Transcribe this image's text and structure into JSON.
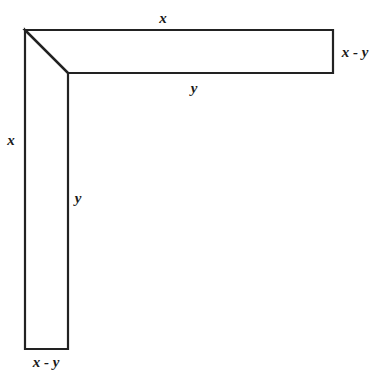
{
  "diagram": {
    "stroke_color": "#222222",
    "labels": {
      "top_edge": "x",
      "right_edge": "x - y",
      "inner_horizontal_edge": "y",
      "left_edge": "x",
      "inner_vertical_edge": "y",
      "bottom_edge": "x - y"
    },
    "geometry": {
      "outer_corner": [
        25,
        30
      ],
      "inner_corner": [
        68,
        73
      ],
      "top_right": [
        333,
        30
      ],
      "right_bottom": [
        333,
        73
      ],
      "bottom_left": [
        25,
        349
      ],
      "bottom_right": [
        68,
        349
      ]
    }
  }
}
